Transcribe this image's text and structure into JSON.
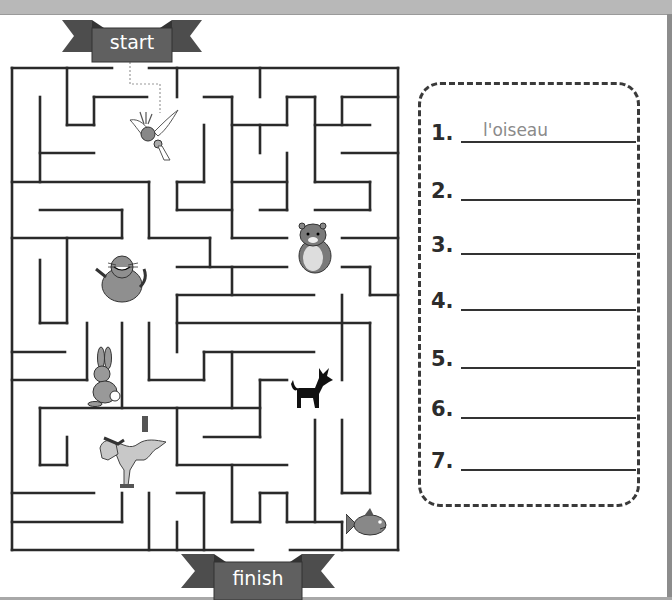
{
  "maze": {
    "start_label": "start",
    "finish_label": "finish",
    "animals": [
      {
        "name": "bird",
        "icon": "parrot-icon"
      },
      {
        "name": "hamster",
        "icon": "hamster-icon"
      },
      {
        "name": "cat",
        "icon": "cat-icon"
      },
      {
        "name": "rabbit",
        "icon": "rabbit-icon"
      },
      {
        "name": "dog",
        "icon": "dog-icon"
      },
      {
        "name": "horse",
        "icon": "horse-icon"
      },
      {
        "name": "fish",
        "icon": "fish-icon"
      }
    ]
  },
  "answers": {
    "items": [
      {
        "number": "1.",
        "value": "l'oiseau"
      },
      {
        "number": "2.",
        "value": ""
      },
      {
        "number": "3.",
        "value": ""
      },
      {
        "number": "4.",
        "value": ""
      },
      {
        "number": "5.",
        "value": ""
      },
      {
        "number": "6.",
        "value": ""
      },
      {
        "number": "7.",
        "value": ""
      }
    ]
  },
  "colors": {
    "banner": "#5f5f5f",
    "banner_dark": "#4a4a4a",
    "wall": "#2a2a2a",
    "answer_text": "#8a8a8a"
  }
}
